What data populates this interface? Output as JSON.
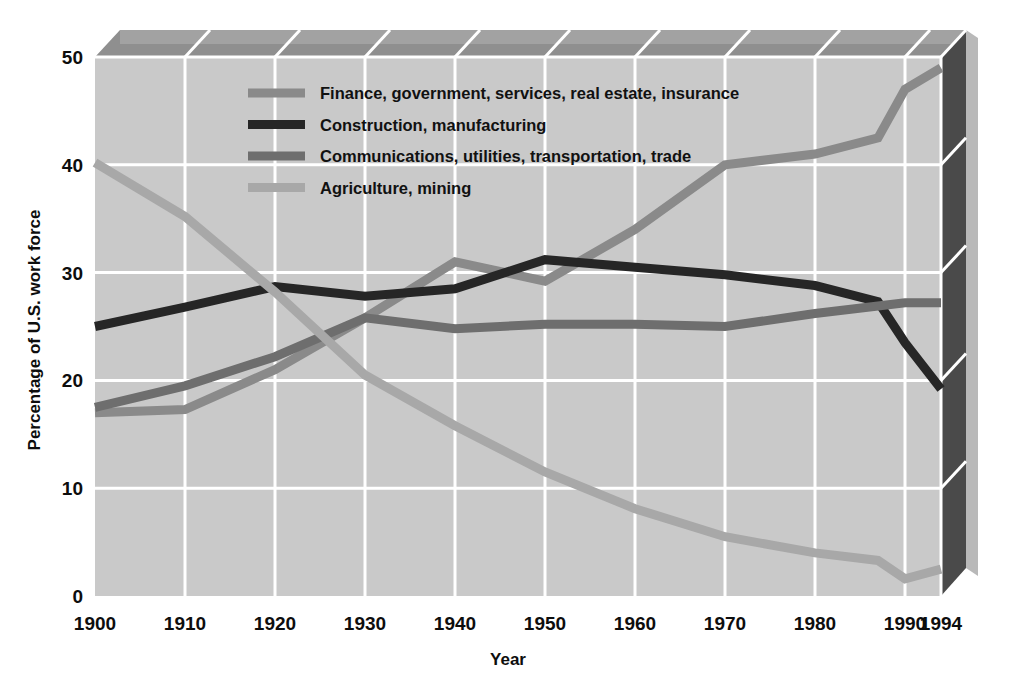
{
  "figure": {
    "background": "#ffffff",
    "plot_fill": "#c9c9c9",
    "plot_top_band": "#8f8f8f",
    "plot_right_panel": "#4a4a4a",
    "gridline_color": "#ffffff"
  },
  "axes": {
    "y_title": "Percentage of U.S. work force",
    "x_title": "Year",
    "y_ticks": [
      "0",
      "10",
      "20",
      "30",
      "40",
      "50"
    ],
    "x_ticks": [
      "1900",
      "1910",
      "1920",
      "1930",
      "1940",
      "1950",
      "1960",
      "1970",
      "1980",
      "1990",
      "1994"
    ]
  },
  "legend": {
    "items": [
      {
        "label": "Finance, government, services, real estate, insurance",
        "color": "#8a8a8a"
      },
      {
        "label": "Construction, manufacturing",
        "color": "#262626"
      },
      {
        "label": "Communications, utilities, transportation, trade",
        "color": "#6e6e6e"
      },
      {
        "label": "Agriculture, mining",
        "color": "#a8a8a8"
      }
    ]
  },
  "chart_data": {
    "type": "line",
    "title": "",
    "xlabel": "Year",
    "ylabel": "Percentage of U.S. work force",
    "xlim": [
      1900,
      1994
    ],
    "ylim": [
      0,
      50
    ],
    "grid": true,
    "legend_position": "upper-center",
    "x": [
      1900,
      1910,
      1920,
      1930,
      1940,
      1950,
      1960,
      1970,
      1980,
      1987,
      1990,
      1994
    ],
    "xtick_values": [
      1900,
      1910,
      1920,
      1930,
      1940,
      1950,
      1960,
      1970,
      1980,
      1990,
      1994
    ],
    "ytick_values": [
      0,
      10,
      20,
      30,
      40,
      50
    ],
    "series": [
      {
        "name": "Finance, government, services, real estate, insurance",
        "color": "#8a8a8a",
        "values": [
          17.0,
          17.3,
          21.0,
          25.8,
          31.0,
          29.2,
          34.0,
          40.0,
          41.0,
          42.5,
          47.0,
          49.0
        ]
      },
      {
        "name": "Construction, manufacturing",
        "color": "#262626",
        "values": [
          25.0,
          26.8,
          28.7,
          27.8,
          28.5,
          31.2,
          30.5,
          29.8,
          28.8,
          27.3,
          23.5,
          19.2
        ]
      },
      {
        "name": "Communications, utilities, transportation, trade",
        "color": "#6e6e6e",
        "values": [
          17.5,
          19.5,
          22.2,
          25.8,
          24.8,
          25.2,
          25.2,
          25.0,
          26.2,
          26.9,
          27.2,
          27.2
        ]
      },
      {
        "name": "Agriculture, mining",
        "color": "#a8a8a8",
        "values": [
          40.2,
          35.2,
          28.2,
          20.5,
          15.8,
          11.5,
          8.1,
          5.5,
          4.0,
          3.3,
          1.6,
          2.5
        ]
      }
    ]
  }
}
